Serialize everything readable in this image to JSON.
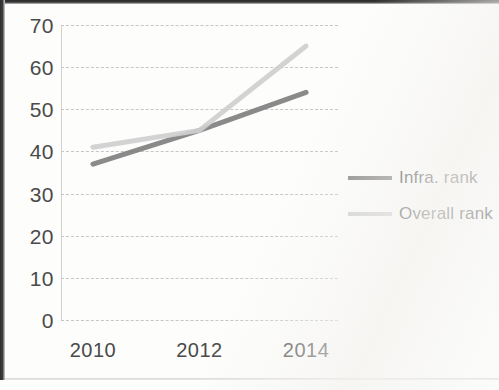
{
  "chart_data": {
    "type": "line",
    "title": "",
    "xlabel": "",
    "ylabel": "",
    "x": [
      2010,
      2012,
      2014
    ],
    "xlim": [
      2009.4,
      2014.6
    ],
    "ylim": [
      0,
      70
    ],
    "y_ticks": [
      70,
      60,
      50,
      40,
      30,
      20,
      10,
      0
    ],
    "x_tick_labels": [
      "2010",
      "2012",
      "2014"
    ],
    "grid": true,
    "legend_position": "right",
    "series": [
      {
        "name": "Infra. rank",
        "color": "#808080",
        "values": [
          37,
          45,
          54
        ]
      },
      {
        "name": "Overall rank",
        "color": "#cfcfcf",
        "values": [
          41,
          45,
          65
        ]
      }
    ]
  },
  "legend": {
    "items": [
      {
        "label": "Infra. rank",
        "color": "#808080"
      },
      {
        "label": "Overall rank",
        "color": "#cfcfcf"
      }
    ]
  }
}
